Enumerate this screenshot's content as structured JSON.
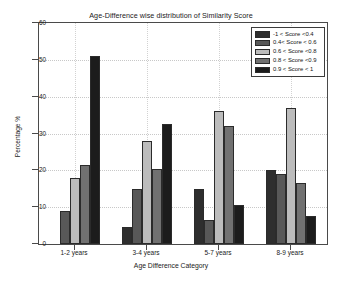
{
  "chart_data": {
    "type": "bar",
    "title": "Age-Difference wise distribution of Similarity Score",
    "xlabel": "Age Difference Category",
    "ylabel": "Percentage %",
    "ylim": [
      0,
      60
    ],
    "yticks": [
      0,
      10,
      20,
      30,
      40,
      50,
      60
    ],
    "ytick_labels": [
      "0",
      "10",
      "20",
      "30",
      "40",
      "50",
      "60"
    ],
    "grid": true,
    "legend_position": "upper right",
    "categories": [
      "1-2 years",
      "3-4 years",
      "5-7 years",
      "8-9 years"
    ],
    "series": [
      {
        "name": "-1 < Score <0.4",
        "color": "#2e2e2e",
        "values": [
          0,
          4.5,
          15,
          20
        ]
      },
      {
        "name": "0.4< Score < 0.6",
        "color": "#585858",
        "values": [
          9,
          15,
          6.5,
          19
        ]
      },
      {
        "name": "0.6 < Score <0.8",
        "color": "#bcbcbc",
        "values": [
          18,
          28,
          36,
          37
        ]
      },
      {
        "name": "0.8 < Score <0.9",
        "color": "#717171",
        "values": [
          21.5,
          20.5,
          32,
          16.5
        ]
      },
      {
        "name": "0.9 < Score < 1",
        "color": "#1c1c1c",
        "values": [
          51,
          32.5,
          10.5,
          7.5
        ]
      }
    ]
  },
  "figure": {
    "background": "#ffffff",
    "axis_color": "#4a4a4a",
    "grid_color": "#c8c8c8",
    "text_color": "#1a1a1a"
  }
}
